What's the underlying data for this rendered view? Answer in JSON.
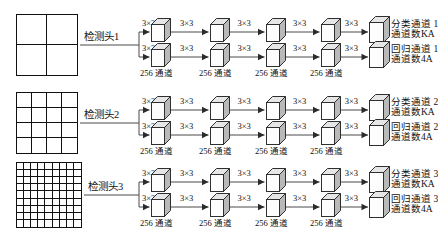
{
  "diagram": {
    "kernel_label": "3×3",
    "channel_label": "256 通道",
    "heads": [
      {
        "name": "检测头1",
        "grid": 2,
        "grid_px": 62,
        "dense": false,
        "branches": [
          {
            "type": "classification",
            "out_l1": "分类通道 1",
            "out_l2": "通道数KA"
          },
          {
            "type": "regression",
            "out_l1": "回归通道 1",
            "out_l2": "通道数4A"
          }
        ]
      },
      {
        "name": "检测头2",
        "grid": 4,
        "grid_px": 62,
        "dense": false,
        "branches": [
          {
            "type": "classification",
            "out_l1": "分类通道 2",
            "out_l2": "通道数KA"
          },
          {
            "type": "regression",
            "out_l1": "回归通道 2",
            "out_l2": "通道数4A"
          }
        ]
      },
      {
        "name": "检测头3",
        "grid": 9,
        "grid_px": 66,
        "dense": true,
        "branches": [
          {
            "type": "classification",
            "out_l1": "分类通道 3",
            "out_l2": "通道数KA"
          },
          {
            "type": "regression",
            "out_l1": "回归通道 3",
            "out_l2": "通道数4A"
          }
        ]
      }
    ],
    "stages_per_branch": 4,
    "colors": {
      "ink": "#111111",
      "wire": "#4a4a4a",
      "cube_front": "#fdfdfd",
      "cube_side": "#b9b9b9",
      "cube_top": "#e6e6e6",
      "paper": "#ffffff"
    }
  }
}
